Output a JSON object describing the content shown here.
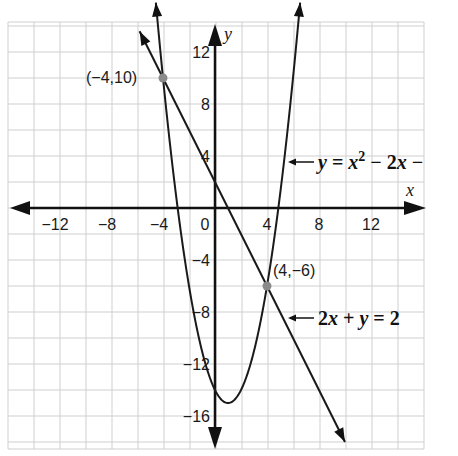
{
  "chart_data": {
    "type": "line",
    "title": "",
    "xlabel": "x",
    "ylabel": "y",
    "xlim": [
      -16,
      16
    ],
    "ylim": [
      -18,
      14
    ],
    "grid": true,
    "grid_step": 2,
    "x_ticks": [
      -12,
      -8,
      -4,
      0,
      4,
      8,
      12
    ],
    "y_ticks": [
      12,
      8,
      4,
      -4,
      -8,
      -12,
      -16
    ],
    "x_tick_labels": [
      "−12",
      "−8",
      "−4",
      "0",
      "4",
      "8",
      "12"
    ],
    "y_tick_labels": [
      "12",
      "8",
      "4",
      "−4",
      "−8",
      "−12",
      "−16"
    ],
    "series": [
      {
        "name": "y = x² − 2x − 14",
        "label_visible": "y = x² − 2x −",
        "kind": "parabola",
        "equation": {
          "a": 1,
          "b": -2,
          "c": -14
        },
        "vertex": [
          1,
          -15
        ],
        "x_range": [
          -4.55,
          6.55
        ]
      },
      {
        "name": "2x + y = 2",
        "label_visible": "2x + y = 2",
        "kind": "line",
        "slope": -2,
        "intercept": 2,
        "x_range": [
          -5.8,
          10
        ]
      }
    ],
    "points": [
      {
        "x": -4,
        "y": 10,
        "label": "(−4,10)"
      },
      {
        "x": 4,
        "y": -6,
        "label": "(4,−6)"
      }
    ],
    "annotations": [
      {
        "text": "y = x² − 2x −",
        "points_to": "parabola"
      },
      {
        "text": "2x + y = 2",
        "points_to": "line"
      }
    ],
    "colors": {
      "grid": "#cfcfcf",
      "curve": "#1a1a1a",
      "point": "#8a8a8a",
      "axis": "#111111"
    }
  },
  "labels": {
    "x_axis": "x",
    "y_axis": "y",
    "point1": "(−4,10)",
    "point2": "(4,−6)",
    "parabola_eq": {
      "y": "y",
      "eq1": " = ",
      "x": "x",
      "sup": "2",
      "minus": " − 2",
      "x2": "x",
      "tail": " −"
    },
    "line_eq": {
      "two": "2",
      "x": "x",
      "plus": " + ",
      "y": "y",
      "eq": " = 2"
    }
  }
}
